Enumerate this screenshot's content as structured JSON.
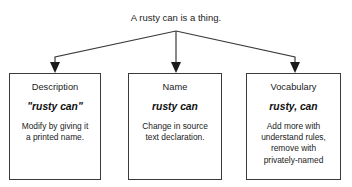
{
  "diagram": {
    "type": "tree",
    "title": "A rusty can is a thing.",
    "background_color": "#ffffff",
    "line_color": "#3a3a3a",
    "text_color": "#1b1b1b",
    "nodes": [
      {
        "id": "description",
        "heading": "Description",
        "term": "\"rusty can\"",
        "body_lines": [
          "Modify by giving it",
          "a printed name."
        ]
      },
      {
        "id": "name",
        "heading": "Name",
        "term": "rusty can",
        "body_lines": [
          "Change in source",
          "text declaration."
        ]
      },
      {
        "id": "vocabulary",
        "heading": "Vocabulary",
        "term": "rusty, can",
        "body_lines": [
          "Add more with",
          "understand rules,",
          "remove with",
          "privately-named"
        ]
      }
    ]
  }
}
